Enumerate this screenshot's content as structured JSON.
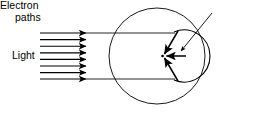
{
  "figure": {
    "type": "optics-physics-diagram",
    "background_color": "#ffffff",
    "stroke_color": "#000000"
  },
  "labels": {
    "light": "Light",
    "electron_paths_line1": "Electron",
    "electron_paths_line2": "paths"
  },
  "light_rays": {
    "count": 8,
    "label": "Light",
    "direction": "left-to-right",
    "x_start": 40,
    "x_arrow_tip": 87,
    "y_values": [
      33,
      39.6,
      46.2,
      52.8,
      59.4,
      66,
      72.6,
      79
    ]
  },
  "outer_circle": {
    "name": "tube-envelope",
    "center_x": 157,
    "center_y": 56,
    "radius": 48
  },
  "inner_arc": {
    "name": "electrode-arc",
    "center_x": 160,
    "center_y": 56,
    "radius": 26,
    "description": "concave electrode arc facing left"
  },
  "focus_point": {
    "x": 163,
    "y": 56
  },
  "electron_paths": [
    {
      "from_x": 180,
      "from_y": 33,
      "to_x": 163,
      "to_y": 56
    },
    {
      "from_x": 186,
      "from_y": 56,
      "to_x": 163,
      "to_y": 56
    },
    {
      "from_x": 180,
      "from_y": 79,
      "to_x": 163,
      "to_y": 56
    }
  ],
  "leader_line": {
    "name": "electron-paths-leader",
    "from_x": 212,
    "from_y": 14,
    "to_x": 180,
    "to_y": 52
  },
  "horizontal_rails": [
    {
      "y": 33,
      "x1": 87,
      "x2": 174
    },
    {
      "y": 79,
      "x1": 87,
      "x2": 174
    }
  ]
}
